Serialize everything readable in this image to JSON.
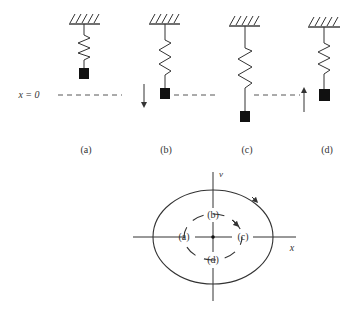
{
  "figure": {
    "equilibrium_label": "x = 0",
    "stages": [
      {
        "id": "a",
        "label": "(a)",
        "description": "mass above equilibrium, at rest",
        "arrow": "none"
      },
      {
        "id": "b",
        "label": "(b)",
        "description": "mass at equilibrium moving down",
        "arrow": "down"
      },
      {
        "id": "c",
        "label": "(c)",
        "description": "mass below equilibrium, at rest",
        "arrow": "none"
      },
      {
        "id": "d",
        "label": "(d)",
        "description": "mass at equilibrium moving up",
        "arrow": "up"
      }
    ],
    "phase_plot": {
      "x_axis_label": "x",
      "y_axis_label": "v",
      "inner_labels": {
        "a": "(a)",
        "b": "(b)",
        "c": "(c)",
        "d": "(d)"
      },
      "direction": "clockwise"
    }
  },
  "colors": {
    "line": "#333333",
    "block": "#111111",
    "background": "#ffffff"
  }
}
